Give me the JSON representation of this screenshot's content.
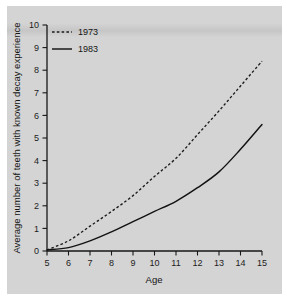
{
  "chart_data": {
    "type": "line",
    "title": "",
    "xlabel": "Age",
    "ylabel": "Average number of teeth with known decay experience",
    "xlim": [
      5,
      15
    ],
    "ylim": [
      0,
      10
    ],
    "grid": false,
    "legend_position": "top-left",
    "x": [
      5,
      6,
      7,
      8,
      9,
      10,
      11,
      12,
      13,
      14,
      15
    ],
    "xtick_labels": [
      "5",
      "6",
      "7",
      "8",
      "9",
      "10",
      "11",
      "12",
      "13",
      "14",
      "15"
    ],
    "ytick_labels": [
      "0",
      "1",
      "2",
      "3",
      "4",
      "5",
      "6",
      "7",
      "8",
      "9",
      "10"
    ],
    "series": [
      {
        "name": "1973",
        "style": "dashed",
        "color": "#1a1a1a",
        "values": [
          0.05,
          0.45,
          1.1,
          1.75,
          2.45,
          3.3,
          4.1,
          5.15,
          6.2,
          7.3,
          8.4
        ]
      },
      {
        "name": "1983",
        "style": "solid",
        "color": "#121212",
        "values": [
          0.05,
          0.15,
          0.45,
          0.85,
          1.3,
          1.75,
          2.2,
          2.8,
          3.5,
          4.5,
          5.6
        ]
      }
    ]
  },
  "legend": {
    "entries": [
      {
        "label": "1973",
        "style": "dashed"
      },
      {
        "label": "1983",
        "style": "solid"
      }
    ]
  },
  "axes": {
    "x_title": "Age",
    "y_title": "Average number of teeth with known decay experience"
  }
}
